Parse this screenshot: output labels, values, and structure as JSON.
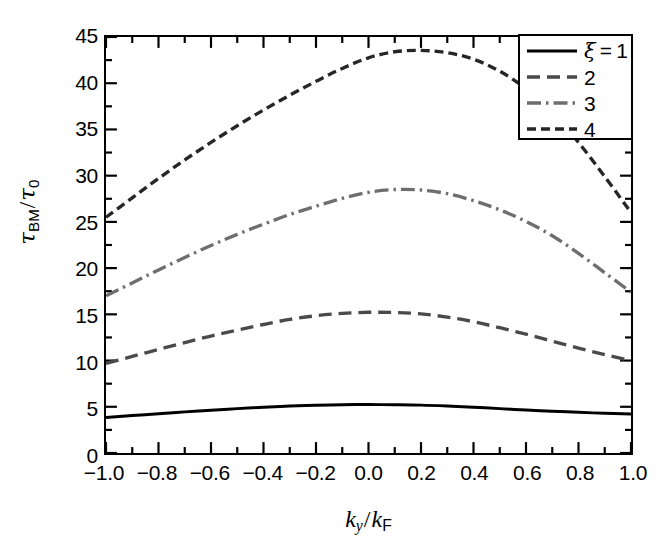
{
  "chart_data": {
    "type": "line",
    "title": "",
    "xlabel": "k_y/k_F",
    "ylabel": "tau_BM/tau_0",
    "xlim": [
      -1.0,
      1.0
    ],
    "ylim": [
      0,
      45
    ],
    "grid": false,
    "legend_position": "top-right",
    "xticks": [
      "-1.0",
      "-0.8",
      "-0.6",
      "-0.4",
      "-0.2",
      "0.0",
      "0.2",
      "0.4",
      "0.6",
      "0.8",
      "1.0"
    ],
    "xtick_values": [
      -1.0,
      -0.8,
      -0.6,
      -0.4,
      -0.2,
      0.0,
      0.2,
      0.4,
      0.6,
      0.8,
      1.0
    ],
    "yticks": [
      "0",
      "5",
      "10",
      "15",
      "20",
      "25",
      "30",
      "35",
      "40",
      "45"
    ],
    "ytick_values": [
      0,
      5,
      10,
      15,
      20,
      25,
      30,
      35,
      40,
      45
    ],
    "x": [
      -1.0,
      -0.9,
      -0.8,
      -0.7,
      -0.6,
      -0.5,
      -0.4,
      -0.3,
      -0.2,
      -0.1,
      0.0,
      0.1,
      0.2,
      0.3,
      0.4,
      0.5,
      0.6,
      0.7,
      0.8,
      0.9,
      1.0
    ],
    "series": [
      {
        "name": "1",
        "legend_label": "ξ = 1",
        "style": "solid",
        "color": "#000000",
        "width": 3.0,
        "values": [
          3.85,
          4.05,
          4.25,
          4.45,
          4.62,
          4.8,
          4.95,
          5.08,
          5.17,
          5.22,
          5.24,
          5.22,
          5.18,
          5.08,
          4.95,
          4.8,
          4.65,
          4.52,
          4.4,
          4.3,
          4.22
        ]
      },
      {
        "name": "2",
        "legend_label": "2",
        "style": "dashed",
        "color": "#4a4a4a",
        "width": 3.4,
        "values": [
          9.7,
          10.45,
          11.2,
          11.95,
          12.65,
          13.3,
          13.9,
          14.45,
          14.85,
          15.1,
          15.22,
          15.2,
          15.05,
          14.7,
          14.2,
          13.55,
          12.85,
          12.1,
          11.35,
          10.65,
          10.0
        ]
      },
      {
        "name": "3",
        "legend_label": "3",
        "style": "dashdot",
        "color": "#6e6e6e",
        "width": 3.4,
        "values": [
          17.0,
          18.4,
          19.8,
          21.15,
          22.45,
          23.65,
          24.75,
          25.8,
          26.7,
          27.55,
          28.2,
          28.5,
          28.45,
          28.05,
          27.3,
          26.3,
          25.05,
          23.5,
          21.6,
          19.5,
          17.4
        ]
      },
      {
        "name": "4",
        "legend_label": "4",
        "style": "shortdash",
        "color": "#262626",
        "width": 3.4,
        "values": [
          25.5,
          27.6,
          29.7,
          31.7,
          33.6,
          35.4,
          37.1,
          38.7,
          40.2,
          41.6,
          42.75,
          43.4,
          43.55,
          43.3,
          42.6,
          41.3,
          39.4,
          36.9,
          33.6,
          29.9,
          26.0
        ]
      }
    ]
  },
  "axes": {
    "ylabel_parts": {
      "tau": "τ",
      "sub_bm": "BM",
      "slash": "/",
      "tau2": "τ",
      "sub_0": "0"
    },
    "xlabel_parts": {
      "k": "k",
      "sub_y": "y",
      "slash": "/",
      "k2": "k",
      "sub_f": "F"
    }
  },
  "legend": {
    "entries": [
      {
        "label": "ξ = 1"
      },
      {
        "label": "2"
      },
      {
        "label": "3"
      },
      {
        "label": "4"
      }
    ]
  },
  "colors": {
    "axis": "#000000",
    "background": "#ffffff",
    "series1": "#000000",
    "series2": "#4a4a4a",
    "series3": "#6e6e6e",
    "series4": "#262626"
  }
}
